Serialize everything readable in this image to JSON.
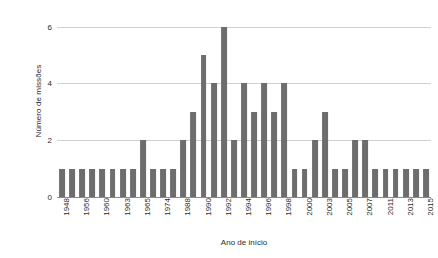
{
  "chart_data": {
    "type": "bar",
    "title": "",
    "xlabel": "Ano de início",
    "ylabel": "Número de missões",
    "ylim": [
      0,
      6.2
    ],
    "yticks": [
      0,
      2,
      4,
      6
    ],
    "ytick_labels": [
      "0",
      "2",
      "4",
      "6"
    ],
    "grid": true,
    "legend": null,
    "bar_color": "#6d6d6d",
    "grid_color": "#d0d0d0",
    "axis_color": "#8a8a8a",
    "text_color": "#2b2b2b",
    "label_every": 2,
    "categories": [
      "1948",
      "1955",
      "1956",
      "1958",
      "1960",
      "1962",
      "1963",
      "1964",
      "1965",
      "1966",
      "1974",
      "1975",
      "1988",
      "1989",
      "1990",
      "1991",
      "1992",
      "1993",
      "1994",
      "1995",
      "1996",
      "1997",
      "1998",
      "1999",
      "2000",
      "2002",
      "2003",
      "2004",
      "2005",
      "2006",
      "2007",
      "2010",
      "2011",
      "2012",
      "2013",
      "2014",
      "2015"
    ],
    "values": [
      1,
      1,
      1,
      1,
      1,
      1,
      1,
      1,
      2,
      1,
      1,
      1,
      2,
      3,
      5,
      4,
      6,
      2,
      4,
      3,
      4,
      3,
      4,
      1,
      1,
      2,
      3,
      1,
      1,
      2,
      2,
      1,
      1,
      1,
      1,
      1,
      1
    ],
    "visible_xtick_labels": [
      "1948",
      "1956",
      "1960",
      "1963",
      "1965",
      "1974",
      "1988",
      "1991",
      "1993",
      "1995",
      "1997",
      "1999",
      "2002",
      "2004",
      "2006",
      "2010",
      "2012",
      "2014"
    ]
  }
}
